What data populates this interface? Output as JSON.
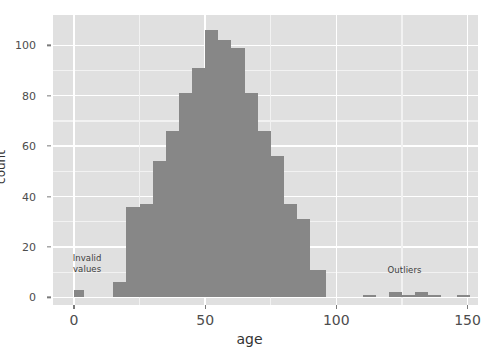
{
  "chart_data": {
    "type": "bar",
    "title": "",
    "subtitle": "",
    "xlabel": "age",
    "ylabel": "count",
    "grid": true,
    "legend": "none",
    "binwidth": 5,
    "xlim": [
      -8,
      154
    ],
    "ylim": [
      -3,
      112
    ],
    "xticks": [
      0,
      50,
      100,
      150
    ],
    "yticks": [
      0,
      20,
      40,
      60,
      80,
      100
    ],
    "x": [
      2,
      17,
      22,
      27,
      32,
      37,
      42,
      47,
      52,
      57,
      62,
      67,
      72,
      77,
      82,
      87,
      92,
      112,
      122,
      127,
      132,
      137,
      147
    ],
    "bins": [
      {
        "x0": 0,
        "x1": 4,
        "count": 3,
        "group": "invalid"
      },
      {
        "x0": 15,
        "x1": 20,
        "count": 6,
        "group": "main"
      },
      {
        "x0": 20,
        "x1": 25,
        "count": 36,
        "group": "main"
      },
      {
        "x0": 25,
        "x1": 30,
        "count": 37,
        "group": "main"
      },
      {
        "x0": 30,
        "x1": 35,
        "count": 54,
        "group": "main"
      },
      {
        "x0": 35,
        "x1": 40,
        "count": 66,
        "group": "main"
      },
      {
        "x0": 40,
        "x1": 45,
        "count": 81,
        "group": "main"
      },
      {
        "x0": 45,
        "x1": 50,
        "count": 91,
        "group": "main"
      },
      {
        "x0": 50,
        "x1": 55,
        "count": 106,
        "group": "main"
      },
      {
        "x0": 55,
        "x1": 60,
        "count": 102,
        "group": "main"
      },
      {
        "x0": 60,
        "x1": 65,
        "count": 99,
        "group": "main"
      },
      {
        "x0": 65,
        "x1": 70,
        "count": 81,
        "group": "main"
      },
      {
        "x0": 70,
        "x1": 75,
        "count": 66,
        "group": "main"
      },
      {
        "x0": 75,
        "x1": 80,
        "count": 56,
        "group": "main"
      },
      {
        "x0": 80,
        "x1": 85,
        "count": 37,
        "group": "main"
      },
      {
        "x0": 85,
        "x1": 90,
        "count": 31,
        "group": "main"
      },
      {
        "x0": 90,
        "x1": 96,
        "count": 11,
        "group": "main"
      },
      {
        "x0": 110,
        "x1": 115,
        "count": 1,
        "group": "outlier"
      },
      {
        "x0": 120,
        "x1": 125,
        "count": 2,
        "group": "outlier"
      },
      {
        "x0": 125,
        "x1": 130,
        "count": 1,
        "group": "outlier"
      },
      {
        "x0": 130,
        "x1": 135,
        "count": 2,
        "group": "outlier"
      },
      {
        "x0": 135,
        "x1": 140,
        "count": 1,
        "group": "outlier"
      },
      {
        "x0": 146,
        "x1": 151,
        "count": 1,
        "group": "outlier"
      }
    ],
    "values": [
      3,
      6,
      36,
      37,
      54,
      66,
      81,
      91,
      106,
      102,
      99,
      81,
      66,
      56,
      37,
      31,
      11,
      1,
      2,
      1,
      2,
      1,
      1
    ],
    "annotations": [
      {
        "id": "invalid-values",
        "text": "Invalid\nvalues",
        "x": 5,
        "y": 13
      },
      {
        "id": "outliers",
        "text": "Outliers",
        "x": 126,
        "y": 8
      }
    ],
    "colors": {
      "bar_fill": "#878787",
      "panel_background": "#e0e0e0",
      "grid_major": "#ffffff",
      "grid_minor": "#f2f2f2",
      "axis_text": "#4d4d4d",
      "axis_title": "#333333",
      "annotation_text": "#3d3d3d",
      "figure_background": "#ffffff"
    }
  },
  "axes": {
    "x_title": "age",
    "y_title": "count",
    "x_tick_labels": [
      "0",
      "50",
      "100",
      "150"
    ],
    "y_tick_labels": [
      "0",
      "20",
      "40",
      "60",
      "80",
      "100"
    ]
  }
}
